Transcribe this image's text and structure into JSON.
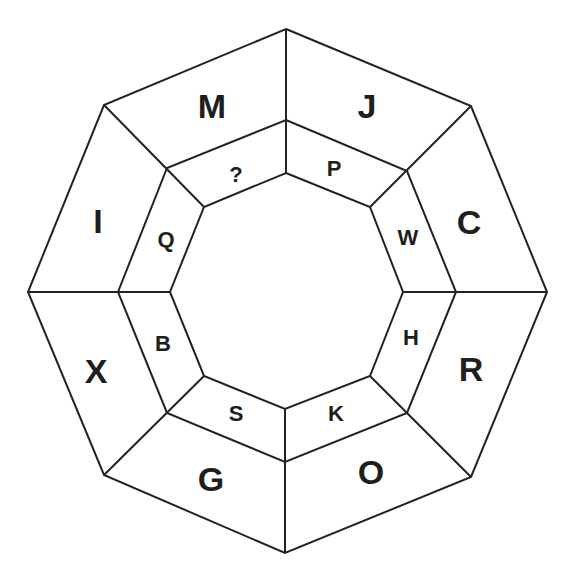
{
  "diagram": {
    "type": "octagon-letter-puzzle",
    "outer_ring": [
      {
        "position": "top-left",
        "label": "M"
      },
      {
        "position": "top-right",
        "label": "J"
      },
      {
        "position": "right-upper",
        "label": "C"
      },
      {
        "position": "right-lower",
        "label": "R"
      },
      {
        "position": "bottom-right",
        "label": "O"
      },
      {
        "position": "bottom-left",
        "label": "G"
      },
      {
        "position": "left-lower",
        "label": "X"
      },
      {
        "position": "left-upper",
        "label": "I"
      }
    ],
    "inner_ring": [
      {
        "position": "top-left",
        "label": "?"
      },
      {
        "position": "top-right",
        "label": "P"
      },
      {
        "position": "right-upper",
        "label": "W"
      },
      {
        "position": "right-lower",
        "label": "H"
      },
      {
        "position": "bottom-right",
        "label": "K"
      },
      {
        "position": "bottom-left",
        "label": "S"
      },
      {
        "position": "left-lower",
        "label": "B"
      },
      {
        "position": "left-upper",
        "label": "Q"
      }
    ],
    "colors": {
      "line": "#222222",
      "text": "#1e1e1e",
      "background": "#ffffff"
    }
  }
}
